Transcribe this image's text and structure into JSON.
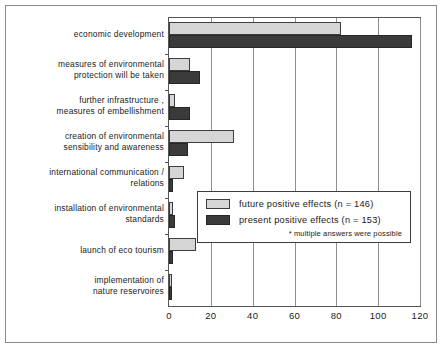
{
  "chart_data": {
    "type": "bar",
    "orientation": "horizontal",
    "title": "",
    "xlabel": "",
    "ylabel": "",
    "xlim": [
      0,
      120
    ],
    "xticks": [
      0,
      20,
      40,
      60,
      80,
      100,
      120
    ],
    "grid": true,
    "legend_position": "center-right",
    "categories": [
      "economic development",
      "measures of environmental\nprotection will be taken",
      "further infrastructure ,\nmeasures of embellishment",
      "creation of environmental\nsensibility and awareness",
      "international communication /\nrelations",
      "installation of environmental\nstandards",
      "launch of eco tourism",
      "implementation of\nnature reservoires"
    ],
    "series": [
      {
        "name": "future positive effects (n = 146)",
        "color": "#d6d6d6",
        "values": [
          82,
          10,
          3,
          31,
          7,
          2,
          13,
          1
        ]
      },
      {
        "name": "present positive effects (n = 153)",
        "color": "#3b3b3b",
        "values": [
          116,
          15,
          10,
          9,
          2,
          3,
          2,
          1
        ]
      }
    ],
    "annotations": [
      "* multiple answers were possible"
    ]
  },
  "legend": {
    "items": [
      {
        "label": "future positive effects (n = 146)"
      },
      {
        "label": "present positive effects (n = 153)"
      }
    ],
    "note": "* multiple answers were possible"
  },
  "axis": {
    "tick_labels": [
      "0",
      "20",
      "40",
      "60",
      "80",
      "100",
      "120"
    ]
  }
}
